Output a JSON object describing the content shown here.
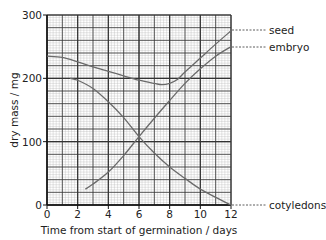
{
  "chart_data": {
    "type": "line",
    "title": "",
    "xlabel": "Time from start of germination / days",
    "ylabel": "dry mass / mg",
    "xlim": [
      0,
      12
    ],
    "ylim": [
      0,
      300
    ],
    "x_ticks": [
      0,
      2,
      4,
      6,
      8,
      10,
      12
    ],
    "y_ticks": [
      0,
      100,
      200,
      300
    ],
    "grid": true,
    "legend_position": "right (line-end labels with dashed leaders)",
    "series": [
      {
        "name": "seed",
        "x": [
          0,
          1,
          2,
          3,
          4,
          5,
          6,
          7,
          7.5,
          8,
          8.5,
          9,
          10,
          11,
          12
        ],
        "y": [
          235,
          233,
          226,
          218,
          211,
          204,
          197,
          192,
          190,
          192,
          198,
          210,
          232,
          254,
          275
        ]
      },
      {
        "name": "embryo",
        "x": [
          2.5,
          3,
          4,
          5,
          6,
          7,
          8,
          9,
          10,
          11,
          12
        ],
        "y": [
          25,
          33,
          52,
          78,
          108,
          137,
          165,
          192,
          215,
          235,
          250
        ]
      },
      {
        "name": "cotyledons",
        "x": [
          1.5,
          2,
          3,
          4,
          5,
          6,
          7,
          8,
          9,
          10,
          11,
          12
        ],
        "y": [
          200,
          197,
          184,
          163,
          138,
          108,
          82,
          60,
          42,
          25,
          12,
          0
        ]
      }
    ]
  },
  "labels": {
    "seed": "seed",
    "embryo": "embryo",
    "cotyledons": "cotyledons",
    "xlabel": "Time from start of germination / days",
    "ylabel": "dry mass / mg"
  },
  "colors": {
    "curve": "#6a6a6a",
    "grid_major": "#333333",
    "grid_minor": "#b5b5b5",
    "text": "#222222"
  }
}
